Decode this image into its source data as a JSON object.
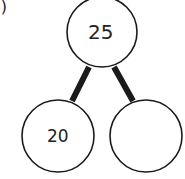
{
  "problem_label": "a)",
  "number_bond": {
    "whole": "25",
    "parts": [
      "20",
      ""
    ]
  },
  "colors": {
    "stroke": "#1a1a1a",
    "text": "#2a2a2a",
    "background": "#ffffff"
  }
}
